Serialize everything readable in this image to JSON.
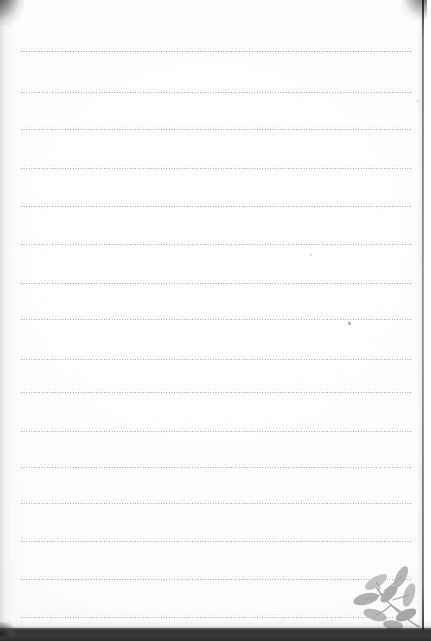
{
  "document": {
    "kind": "scanned-lined-notebook-page",
    "title": "Blank lined notebook page",
    "page_width": 431,
    "page_height": 641,
    "paper_color": "#ffffff",
    "rule_color": "#6e6e78",
    "rule_style": "dotted",
    "text_content": "",
    "handwriting": "",
    "typed_text": ""
  },
  "paper": {
    "sheet_left": 0,
    "sheet_top": 0,
    "sheet_width": 423,
    "sheet_height": 629,
    "edge_color": "#1e1e1e",
    "bottom_band_color": "#343434"
  },
  "rules": {
    "count": 15,
    "left": 21,
    "right": 411,
    "label": "dotted ruled writing lines",
    "lines": [
      {
        "index": 1,
        "y": 50,
        "left": 21,
        "width": 390,
        "opacity": 0.92
      },
      {
        "index": 2,
        "y": 91,
        "left": 21,
        "width": 390,
        "opacity": 0.88
      },
      {
        "index": 3,
        "y": 128,
        "left": 21,
        "width": 390,
        "opacity": 0.86
      },
      {
        "index": 4,
        "y": 167,
        "left": 21,
        "width": 390,
        "opacity": 0.85
      },
      {
        "index": 5,
        "y": 205,
        "left": 21,
        "width": 390,
        "opacity": 0.88
      },
      {
        "index": 6,
        "y": 243,
        "left": 21,
        "width": 390,
        "opacity": 0.84
      },
      {
        "index": 7,
        "y": 282,
        "left": 21,
        "width": 390,
        "opacity": 0.86
      },
      {
        "index": 8,
        "y": 318,
        "left": 21,
        "width": 390,
        "opacity": 0.88
      },
      {
        "index": 9,
        "y": 358,
        "left": 21,
        "width": 390,
        "opacity": 0.82
      },
      {
        "index": 10,
        "y": 391,
        "left": 21,
        "width": 390,
        "opacity": 0.86
      },
      {
        "index": 11,
        "y": 430,
        "left": 21,
        "width": 390,
        "opacity": 0.84
      },
      {
        "index": 12,
        "y": 466,
        "left": 21,
        "width": 390,
        "opacity": 0.84
      },
      {
        "index": 13,
        "y": 502,
        "left": 21,
        "width": 390,
        "opacity": 0.86
      },
      {
        "index": 14,
        "y": 540,
        "left": 21,
        "width": 390,
        "opacity": 0.84
      },
      {
        "index": 15,
        "y": 578,
        "left": 21,
        "width": 390,
        "opacity": 0.86
      },
      {
        "index": 16,
        "y": 616,
        "left": 21,
        "width": 372,
        "opacity": 0.82
      }
    ]
  },
  "marks": [
    {
      "name": "ink-speck",
      "x": 348,
      "y": 322,
      "note": "small gray speck below line 8"
    },
    {
      "name": "ink-speck-faint",
      "x": 417,
      "y": 100,
      "note": "faint dot near right margin"
    },
    {
      "name": "ink-speck-faint",
      "x": 310,
      "y": 254,
      "note": "faint dot mid page"
    }
  ],
  "decoration": {
    "name": "leaf-sprig-illustration",
    "position": "bottom-right",
    "color": "#b4b4b4",
    "description": "gray botanical leaf sprig watermark"
  }
}
